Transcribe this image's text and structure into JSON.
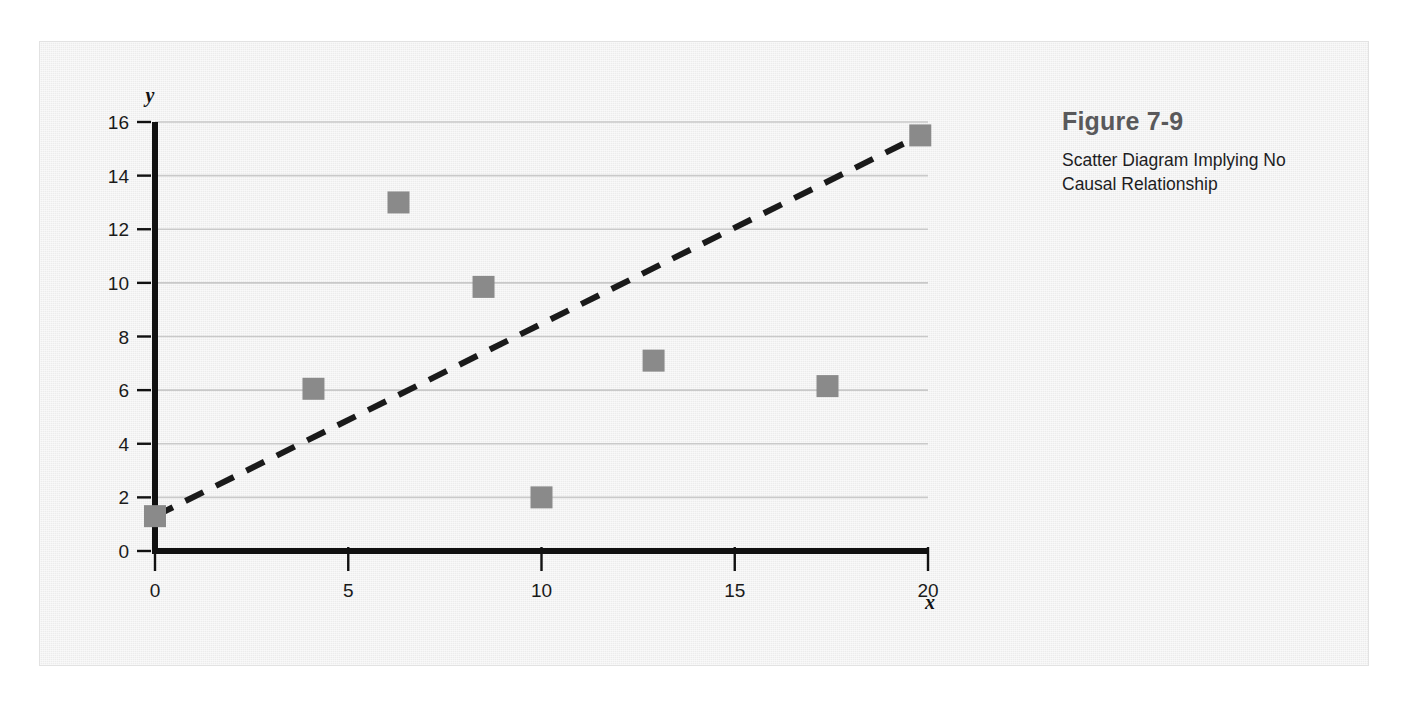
{
  "figure": {
    "number": "Figure 7-9",
    "caption": "Scatter Diagram Implying No Causal Relationship"
  },
  "colors": {
    "panel_background": "#ececec",
    "marker": "#8a8a8a",
    "axis": "#111111",
    "gridline": "#c9c9c9",
    "trendline": "#1a1a1a",
    "figure_number_text": "#59595b",
    "caption_text": "#1d1d1f"
  },
  "chart_data": {
    "type": "scatter",
    "title": "",
    "xlabel": "x",
    "ylabel": "y",
    "xlim": [
      0,
      20
    ],
    "ylim": [
      0,
      16
    ],
    "xticks": [
      0,
      5,
      10,
      15,
      20
    ],
    "yticks": [
      0,
      2,
      4,
      6,
      8,
      10,
      12,
      14,
      16
    ],
    "xtick_labels": [
      "0",
      "5",
      "10",
      "15",
      "20"
    ],
    "ytick_labels": [
      "0",
      "2",
      "4",
      "6",
      "8",
      "10",
      "12",
      "14",
      "16"
    ],
    "grid": "horizontal",
    "legend": "none",
    "series": [
      {
        "name": "observations",
        "marker": "square",
        "points": [
          {
            "x": 0.0,
            "y": 1.3
          },
          {
            "x": 4.1,
            "y": 6.05
          },
          {
            "x": 6.3,
            "y": 13.0
          },
          {
            "x": 8.5,
            "y": 9.85
          },
          {
            "x": 10.0,
            "y": 2.0
          },
          {
            "x": 12.9,
            "y": 7.1
          },
          {
            "x": 17.4,
            "y": 6.15
          },
          {
            "x": 19.8,
            "y": 15.5
          }
        ]
      },
      {
        "name": "trend-line",
        "style": "dashed",
        "points": [
          {
            "x": 0.0,
            "y": 1.3
          },
          {
            "x": 19.8,
            "y": 15.5
          }
        ]
      }
    ]
  }
}
